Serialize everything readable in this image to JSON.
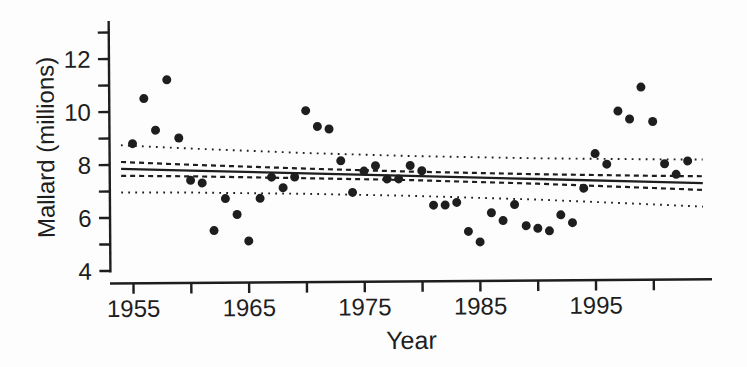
{
  "figure": {
    "background": "#fdfdfd",
    "ink_color": "#1e1e1e",
    "width": 747,
    "height": 367
  },
  "chart_data": {
    "type": "scatter",
    "title": "",
    "xlabel": "Year",
    "ylabel": "Mallard (millions)",
    "xlim": [
      1953,
      2005.3
    ],
    "ylim": [
      3.9,
      13.5
    ],
    "grid": false,
    "legend": "none",
    "x_ticks_all": [
      1955,
      1960,
      1965,
      1970,
      1975,
      1980,
      1985,
      1990,
      1995,
      2000
    ],
    "x_ticks_labeled": [
      1955,
      1965,
      1975,
      1985,
      1995
    ],
    "y_ticks_all": [
      4,
      5,
      6,
      7,
      8,
      9,
      10,
      11,
      12,
      13
    ],
    "y_ticks_labeled": [
      4,
      6,
      8,
      10,
      12
    ],
    "series": [
      {
        "name": "mallard-breeding-population",
        "marker": "filled-circle",
        "x": [
          1955,
          1956,
          1957,
          1958,
          1959,
          1960,
          1961,
          1962,
          1963,
          1964,
          1965,
          1966,
          1967,
          1968,
          1969,
          1970,
          1971,
          1972,
          1973,
          1974,
          1975,
          1976,
          1977,
          1978,
          1979,
          1980,
          1981,
          1982,
          1983,
          1984,
          1985,
          1986,
          1987,
          1988,
          1989,
          1990,
          1991,
          1992,
          1993,
          1994,
          1995,
          1996,
          1997,
          1998,
          1999,
          2000,
          2001,
          2002,
          2003
        ],
        "y": [
          8.8,
          10.5,
          9.3,
          11.2,
          9.0,
          7.4,
          7.3,
          5.5,
          6.7,
          6.1,
          5.1,
          6.7,
          7.5,
          7.1,
          7.5,
          10.0,
          9.4,
          9.3,
          8.1,
          6.9,
          7.7,
          7.9,
          7.4,
          7.4,
          7.9,
          7.7,
          6.4,
          6.4,
          6.5,
          5.4,
          5.0,
          6.1,
          5.8,
          6.4,
          5.6,
          5.5,
          5.4,
          6.0,
          5.7,
          7.0,
          8.3,
          7.9,
          9.9,
          9.6,
          10.8,
          9.5,
          7.9,
          7.5,
          8.0
        ]
      }
    ],
    "fit": {
      "x": [
        1954,
        1960,
        1970,
        1979,
        1990,
        2000,
        2004.3
      ],
      "regression_line": [
        7.85,
        7.77,
        7.63,
        7.51,
        7.36,
        7.22,
        7.16
      ],
      "confidence_upper": [
        8.11,
        7.99,
        7.81,
        7.67,
        7.54,
        7.45,
        7.42
      ],
      "confidence_lower": [
        7.59,
        7.55,
        7.45,
        7.35,
        7.18,
        6.99,
        6.9
      ],
      "prediction_upper": [
        8.74,
        8.6,
        8.4,
        8.26,
        8.14,
        8.07,
        8.05
      ],
      "prediction_lower": [
        6.96,
        6.94,
        6.86,
        6.76,
        6.58,
        6.37,
        6.27
      ],
      "styles": {
        "regression_line": "solid",
        "confidence_band": "dashed",
        "prediction_band": "dotted"
      }
    }
  }
}
